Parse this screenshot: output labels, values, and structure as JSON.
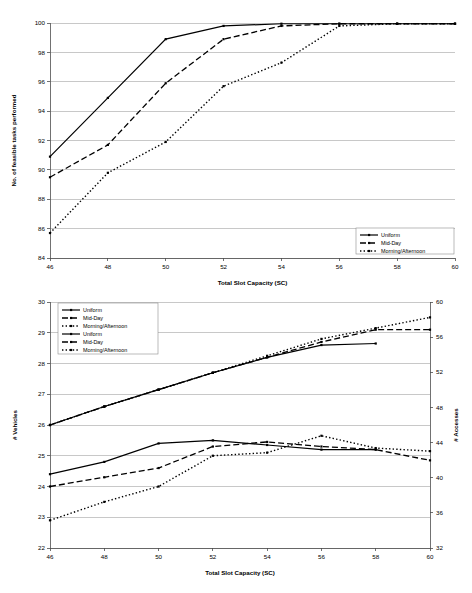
{
  "figure": {
    "background": "#ffffff",
    "line_color": "#000000",
    "grid_color": "#9a9a9a"
  },
  "chart_data": [
    {
      "id": "top",
      "type": "line",
      "title": "",
      "xlabel": "Total Slot Capacity (SC)",
      "ylabel": "No. of feasible tasks performed",
      "xlim": [
        46,
        60
      ],
      "ylim": [
        84,
        100
      ],
      "xticks": [
        46,
        48,
        50,
        52,
        54,
        56,
        58,
        60
      ],
      "yticks": [
        84,
        86,
        88,
        90,
        92,
        94,
        96,
        98,
        100
      ],
      "grid": "horizontal",
      "legend_position": "bottom-right",
      "x": [
        46,
        48,
        50,
        52,
        54,
        56,
        58,
        60
      ],
      "series": [
        {
          "name": "Uniform",
          "style": "solid",
          "values": [
            90.9,
            94.9,
            98.9,
            99.8,
            99.95,
            99.95,
            99.95,
            99.95
          ]
        },
        {
          "name": "Mid-Day",
          "style": "dashed",
          "values": [
            89.5,
            91.7,
            95.9,
            98.9,
            99.8,
            99.95,
            99.95,
            99.95
          ]
        },
        {
          "name": "Morning/Afternoon",
          "style": "dotted",
          "values": [
            85.7,
            89.8,
            91.9,
            95.7,
            97.3,
            99.8,
            99.95,
            99.95
          ]
        }
      ]
    },
    {
      "id": "bottom",
      "type": "line",
      "title": "",
      "xlabel": "Total Slot Capacity (SC)",
      "ylabel": "# Vehicles",
      "y2label": "# Accesses",
      "xlim": [
        46,
        60
      ],
      "ylim": [
        22,
        30
      ],
      "y2lim": [
        32,
        60
      ],
      "xticks": [
        46,
        48,
        50,
        52,
        54,
        56,
        58,
        60
      ],
      "yticks": [
        22,
        23,
        24,
        25,
        26,
        27,
        28,
        29,
        30
      ],
      "y2ticks": [
        32,
        36,
        40,
        44,
        48,
        52,
        56,
        60
      ],
      "grid": "horizontal",
      "legend_position": "top-left",
      "x": [
        46,
        48,
        50,
        52,
        54,
        56,
        58,
        60
      ],
      "series": [
        {
          "name": "Uniform",
          "axis": "right",
          "style": "solid",
          "values": [
            26.0,
            26.6,
            27.15,
            27.7,
            28.2,
            28.6,
            28.65,
            null
          ]
        },
        {
          "name": "Mid-Day",
          "axis": "right",
          "style": "dashed",
          "values": [
            26.0,
            26.6,
            27.15,
            27.7,
            28.2,
            28.7,
            29.1,
            29.1
          ]
        },
        {
          "name": "Morning/Afternoon",
          "axis": "right",
          "style": "dotted",
          "values": [
            26.0,
            26.6,
            27.15,
            27.7,
            28.25,
            28.8,
            29.15,
            29.5
          ]
        },
        {
          "name": "Uniform",
          "axis": "left",
          "style": "solid",
          "values": [
            24.4,
            24.8,
            25.4,
            25.5,
            25.35,
            25.2,
            25.2,
            null
          ]
        },
        {
          "name": "Mid-Day",
          "axis": "left",
          "style": "dashed",
          "values": [
            24.0,
            24.3,
            24.6,
            25.3,
            25.45,
            25.3,
            25.2,
            24.85
          ]
        },
        {
          "name": "Morning/Afternoon",
          "axis": "left",
          "style": "dotted",
          "values": [
            22.9,
            23.5,
            24.0,
            25.0,
            25.1,
            25.65,
            25.25,
            25.15
          ]
        }
      ]
    }
  ]
}
